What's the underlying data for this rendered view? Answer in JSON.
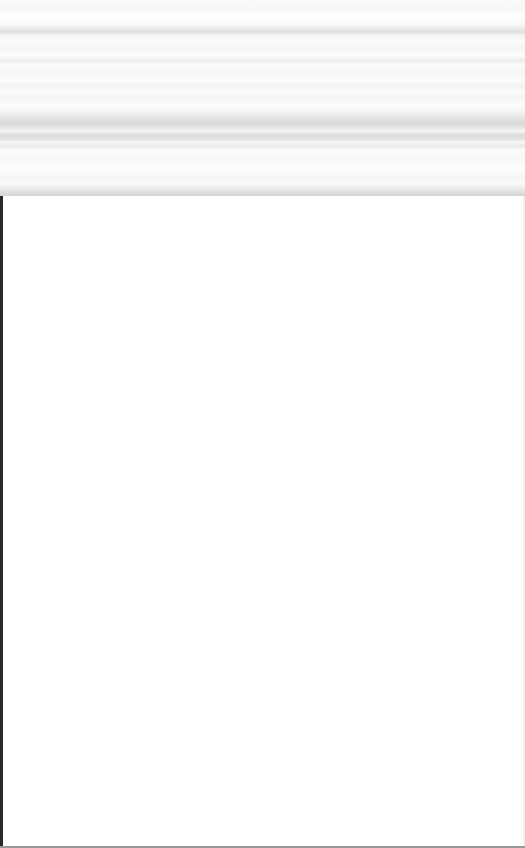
{
  "page": {
    "state": "blank-loading",
    "header_band": {
      "visible_text": ""
    },
    "content_area": {
      "visible_text": ""
    }
  },
  "colors": {
    "background": "#ffffff",
    "header_stripe_dark": "#d9d9d9",
    "left_border": "#2a2a2a",
    "bottom_border": "#9a9a9a"
  }
}
